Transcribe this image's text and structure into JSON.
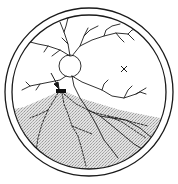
{
  "diagram": {
    "colors": {
      "background": "#ffffff",
      "stroke": "#1a1a1a",
      "detachment_fill": "#d4d4d4"
    },
    "elements": {
      "outer_ring": {
        "cx": 89,
        "cy": 92,
        "r": 84
      },
      "inner_ring": {
        "cx": 89,
        "cy": 92,
        "r": 77
      },
      "optic_disc": {
        "cx": 70,
        "cy": 66,
        "r": 11
      },
      "macula_marker": {
        "glyph": "×",
        "x": 124,
        "y": 69
      },
      "retinal_break": {
        "x": 56,
        "y": 89,
        "width": 10,
        "height": 4
      },
      "arrow": {
        "from": [
          51,
          73
        ],
        "to": [
          59,
          88
        ]
      }
    }
  }
}
